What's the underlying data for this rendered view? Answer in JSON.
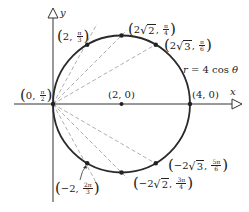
{
  "figure": {
    "type": "polar-graph",
    "equation": {
      "lhs": "r",
      "eq": "=",
      "rhs": "4 cos",
      "var": "θ"
    },
    "axes": {
      "x_label": "x",
      "y_label": "y"
    },
    "center_point": {
      "label": "(2, 0)"
    },
    "points": [
      {
        "id": "p0",
        "r": "0",
        "theta_num": "π",
        "theta_den": "2",
        "paren_l": "(",
        "paren_r": ")",
        "sep": ",",
        "r_text": "0"
      },
      {
        "id": "p60",
        "r": "2",
        "theta_num": "π",
        "theta_den": "3",
        "paren_l": "(",
        "paren_r": ")",
        "sep": ",",
        "r_text": "2"
      },
      {
        "id": "p45",
        "r": "2√2",
        "theta_num": "π",
        "theta_den": "4",
        "paren_l": "(",
        "paren_r": ")",
        "sep": ",",
        "coef": "2",
        "radicand": "2"
      },
      {
        "id": "p30",
        "r": "2√3",
        "theta_num": "π",
        "theta_den": "6",
        "paren_l": "(",
        "paren_r": ")",
        "sep": ",",
        "coef": "2",
        "radicand": "3"
      },
      {
        "id": "p40",
        "r": "4",
        "label": "(4, 0)"
      },
      {
        "id": "pm120",
        "r": "−2",
        "theta_num": "2π",
        "theta_den": "3",
        "paren_l": "(",
        "paren_r": ")",
        "sep": ",",
        "r_text": "−2"
      },
      {
        "id": "pm135",
        "r": "−2√2",
        "theta_num": "3π",
        "theta_den": "4",
        "paren_l": "(",
        "paren_r": ")",
        "sep": ",",
        "coef": "−2",
        "radicand": "2"
      },
      {
        "id": "pm150",
        "r": "−2√3",
        "theta_num": "5π",
        "theta_den": "6",
        "paren_l": "(",
        "paren_r": ")",
        "sep": ",",
        "coef": "−2",
        "radicand": "3"
      }
    ],
    "colors": {
      "curve": "#2a2a2a",
      "axis": "#333333",
      "dashed": "#9a9a9a",
      "text": "#222222"
    }
  }
}
